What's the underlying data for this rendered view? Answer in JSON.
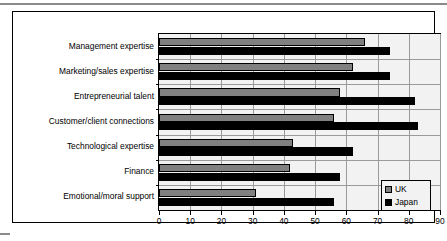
{
  "chart_data": {
    "type": "bar",
    "orientation": "horizontal",
    "title": "",
    "xlabel": "",
    "ylabel": "",
    "xlim": [
      0,
      90
    ],
    "xticks": [
      0,
      10,
      20,
      30,
      40,
      50,
      60,
      70,
      80,
      90
    ],
    "grid": true,
    "legend_position": "bottom-right",
    "categories": [
      "Management expertise",
      "Marketing/sales expertise",
      "Entrepreneurial talent",
      "Customer/client connections",
      "Technological expertise",
      "Finance",
      "Emotional/moral support"
    ],
    "series": [
      {
        "name": "UK",
        "color": "#808080",
        "values": [
          66,
          62,
          58,
          56,
          43,
          42,
          31
        ]
      },
      {
        "name": "Japan",
        "color": "#000000",
        "values": [
          74,
          74,
          82,
          83,
          62,
          58,
          56
        ]
      }
    ]
  },
  "legend": {
    "items": [
      {
        "label": "UK",
        "swatch": "#808080"
      },
      {
        "label": "Japan",
        "swatch": "#000000"
      }
    ]
  },
  "axis": {
    "tick_labels": [
      "0",
      "10",
      "20",
      "30",
      "40",
      "50",
      "60",
      "70",
      "80",
      "90"
    ]
  }
}
